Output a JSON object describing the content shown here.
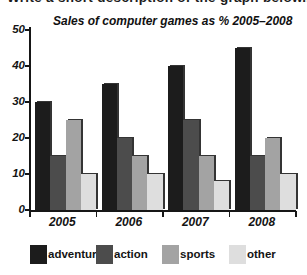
{
  "heading": {
    "text": "Write a short description of the graph below..."
  },
  "chart_data": {
    "type": "bar",
    "title": "Sales of computer games as % 2005–2008",
    "categories": [
      "2005",
      "2006",
      "2007",
      "2008"
    ],
    "series": [
      {
        "name": "adventure",
        "color": "#1c1c1c",
        "values": [
          30,
          35,
          40,
          45
        ]
      },
      {
        "name": "action",
        "color": "#4c4c4c",
        "values": [
          15,
          20,
          25,
          15
        ]
      },
      {
        "name": "sports",
        "color": "#a3a3a3",
        "values": [
          25,
          15,
          15,
          20
        ]
      },
      {
        "name": "other",
        "color": "#dedede",
        "values": [
          10,
          10,
          8,
          10
        ]
      }
    ],
    "xlabel": "",
    "ylabel": "",
    "ylim": [
      0,
      50
    ],
    "yticks": [
      0,
      10,
      20,
      30,
      40,
      50
    ],
    "grid": false,
    "legend_position": "bottom",
    "axis_color": "#161616",
    "background": "#ffffff"
  }
}
